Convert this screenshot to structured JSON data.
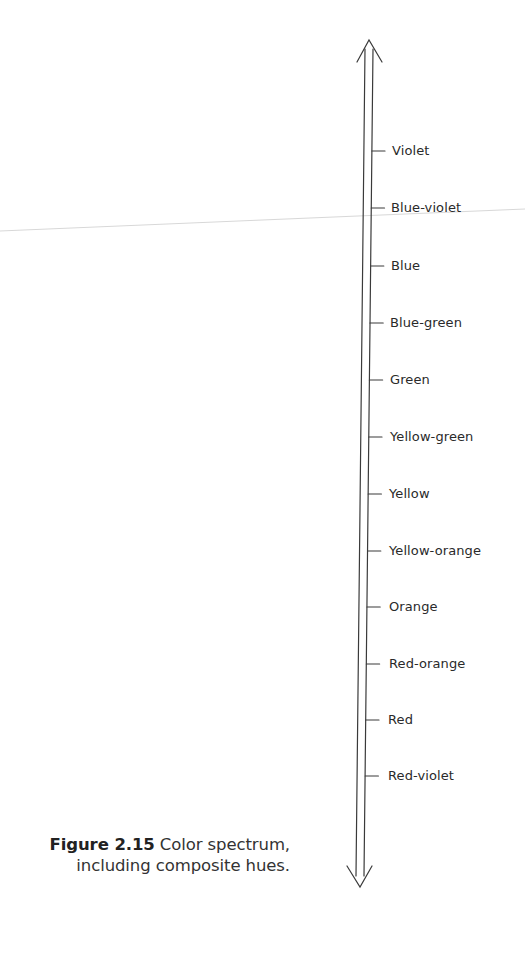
{
  "diagram": {
    "type": "vertical-spectrum-scale",
    "axis": {
      "style": "double-line double-headed arrow",
      "color": "#3a3a3a"
    },
    "labels": [
      "Violet",
      "Blue-violet",
      "Blue",
      "Blue-green",
      "Green",
      "Yellow-green",
      "Yellow",
      "Yellow-orange",
      "Orange",
      "Red-orange",
      "Red",
      "Red-violet"
    ]
  },
  "caption": {
    "figure_number": "Figure 2.15",
    "text_line1": " Color spectrum,",
    "text_line2": "including composite hues."
  },
  "colors": {
    "text": "#2a2a2a",
    "lines": "#3a3a3a",
    "background": "#ffffff"
  }
}
